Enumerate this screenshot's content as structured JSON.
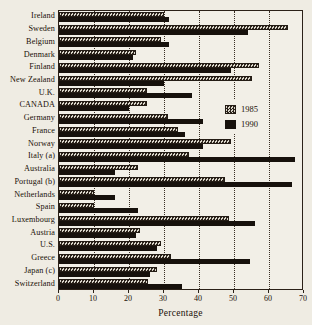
{
  "chart_data": {
    "type": "bar",
    "orientation": "horizontal",
    "title": "",
    "xlabel": "Percentage",
    "ylabel": "",
    "xlim": [
      0,
      70
    ],
    "xticks": [
      0,
      10,
      20,
      30,
      40,
      50,
      60,
      70
    ],
    "xtick_labels": [
      "0",
      "10",
      "20",
      "30",
      "40",
      "50",
      "60",
      "70"
    ],
    "grid": "vertical-dotted",
    "legend_position": "middle-right",
    "categories": [
      "Ireland",
      "Sweden",
      "Belgium",
      "Denmark",
      "Finland",
      "New Zealand",
      "U.K.",
      "CANADA",
      "Germany",
      "France",
      "Norway",
      "Italy (a)",
      "Australia",
      "Portugal (b)",
      "Netherlands",
      "Spain",
      "Luxembourg",
      "Austria",
      "U.S.",
      "Greece",
      "Japan (c)",
      "Switzerland"
    ],
    "series": [
      {
        "name": "1985",
        "pattern": "checkered",
        "color": "#2a211a",
        "values": [
          30,
          65.5,
          29,
          22,
          57,
          55,
          25,
          25,
          31,
          34,
          49,
          37,
          22.5,
          47.5,
          10,
          10,
          48.5,
          23,
          29,
          32,
          28,
          25.5
        ]
      },
      {
        "name": "1990",
        "pattern": "solid",
        "color": "#17110c",
        "values": [
          31.5,
          54,
          31.5,
          21,
          49,
          30,
          38,
          20,
          41,
          36,
          41,
          67.5,
          16,
          66.5,
          16,
          22.5,
          56,
          22,
          28,
          54.5,
          26,
          35
        ]
      }
    ]
  },
  "legend": {
    "entries": [
      {
        "label": "1985"
      },
      {
        "label": "1990"
      }
    ]
  }
}
